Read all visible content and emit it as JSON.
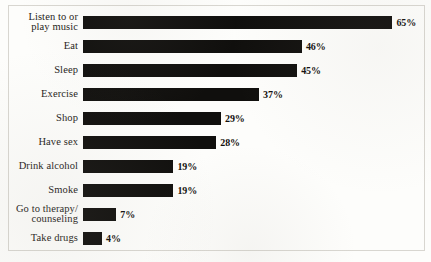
{
  "chart_data": {
    "type": "bar",
    "orientation": "horizontal",
    "title": "",
    "subtitle": "",
    "xlabel": "",
    "ylabel": "",
    "xlim": [
      0,
      65
    ],
    "grid": false,
    "legend": null,
    "bar_color": "#100f0d",
    "background_color": "#fdfdfb",
    "categories": [
      "Listen to or\nplay music",
      "Eat",
      "Sleep",
      "Exercise",
      "Shop",
      "Have sex",
      "Drink alcohol",
      "Smoke",
      "Go to therapy/\ncounseling",
      "Take drugs"
    ],
    "values": [
      65,
      46,
      45,
      37,
      29,
      28,
      19,
      19,
      7,
      4
    ],
    "value_labels": [
      "65%",
      "46%",
      "45%",
      "37%",
      "29%",
      "28%",
      "19%",
      "19%",
      "7%",
      "4%"
    ]
  },
  "layout": {
    "bar_origin_x": 83,
    "px_per_percent": 4.76,
    "row_height": 24,
    "first_row_top": 10,
    "bar_thickness": 13
  }
}
